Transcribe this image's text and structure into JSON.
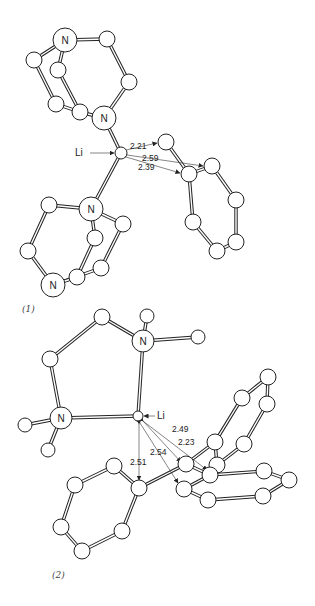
{
  "figure": {
    "structures": [
      {
        "id": "s1",
        "caption": "(1)",
        "caption_pos": [
          22,
          312
        ],
        "li_label": "Li",
        "li_label_pos": [
          75,
          156
        ],
        "li_arrow": [
          [
            90,
            153
          ],
          [
            114,
            153
          ]
        ],
        "atoms": [
          {
            "id": "N1",
            "x": 65,
            "y": 40,
            "r": 12,
            "label": "N"
          },
          {
            "id": "C1",
            "x": 107,
            "y": 39,
            "r": 8
          },
          {
            "id": "C2",
            "x": 129,
            "y": 82,
            "r": 8
          },
          {
            "id": "N2",
            "x": 104,
            "y": 118,
            "r": 12,
            "label": "N"
          },
          {
            "id": "C3",
            "x": 80,
            "y": 112,
            "r": 8
          },
          {
            "id": "C4",
            "x": 56,
            "y": 104,
            "r": 8
          },
          {
            "id": "C5",
            "x": 58,
            "y": 70,
            "r": 8
          },
          {
            "id": "C6",
            "x": 34,
            "y": 60,
            "r": 8
          },
          {
            "id": "Li",
            "x": 121,
            "y": 153,
            "r": 6
          },
          {
            "id": "N3",
            "x": 91,
            "y": 209,
            "r": 12,
            "label": "N"
          },
          {
            "id": "C7",
            "x": 49,
            "y": 205,
            "r": 8
          },
          {
            "id": "C8",
            "x": 123,
            "y": 224,
            "r": 8
          },
          {
            "id": "C9",
            "x": 95,
            "y": 238,
            "r": 8
          },
          {
            "id": "C10",
            "x": 28,
            "y": 251,
            "r": 8
          },
          {
            "id": "C11",
            "x": 101,
            "y": 268,
            "r": 8
          },
          {
            "id": "C12",
            "x": 77,
            "y": 277,
            "r": 8
          },
          {
            "id": "N4",
            "x": 53,
            "y": 285,
            "r": 12,
            "label": "N"
          },
          {
            "id": "P1",
            "x": 166,
            "y": 142,
            "r": 8
          },
          {
            "id": "P2",
            "x": 189,
            "y": 174,
            "r": 8
          },
          {
            "id": "P3",
            "x": 212,
            "y": 166,
            "r": 8
          },
          {
            "id": "P4",
            "x": 236,
            "y": 200,
            "r": 8
          },
          {
            "id": "P5",
            "x": 236,
            "y": 242,
            "r": 8
          },
          {
            "id": "P6",
            "x": 217,
            "y": 251,
            "r": 8
          },
          {
            "id": "P7",
            "x": 193,
            "y": 222,
            "r": 8
          }
        ],
        "bonds": [
          [
            "N1",
            "C1"
          ],
          [
            "C1",
            "C2"
          ],
          [
            "C2",
            "N2"
          ],
          [
            "N1",
            "C6"
          ],
          [
            "C6",
            "C4"
          ],
          [
            "C4",
            "C3"
          ],
          [
            "C3",
            "N2"
          ],
          [
            "N1",
            "C5"
          ],
          [
            "C5",
            "C3"
          ],
          [
            "N2",
            "Li"
          ],
          [
            "Li",
            "N3"
          ],
          [
            "N3",
            "C7"
          ],
          [
            "C7",
            "C10"
          ],
          [
            "C10",
            "N4"
          ],
          [
            "N3",
            "C8"
          ],
          [
            "C8",
            "C11"
          ],
          [
            "C11",
            "N4"
          ],
          [
            "N3",
            "C9"
          ],
          [
            "C9",
            "C12"
          ],
          [
            "C12",
            "N4"
          ],
          [
            "P1",
            "P2"
          ],
          [
            "P2",
            "P3"
          ],
          [
            "P3",
            "P4"
          ],
          [
            "P4",
            "P5"
          ],
          [
            "P5",
            "P6"
          ],
          [
            "P6",
            "P7"
          ],
          [
            "P7",
            "P2"
          ]
        ],
        "distances": [
          {
            "label": "2.21",
            "from": [
              126,
              150
            ],
            "to": [
              157,
              143
            ],
            "label_pos": [
              130,
              149
            ]
          },
          {
            "label": "2.59",
            "from": [
              127,
              155
            ],
            "to": [
              203,
              166
            ],
            "label_pos": [
              142,
              161
            ]
          },
          {
            "label": "2.39",
            "from": [
              126,
              157
            ],
            "to": [
              180,
              173
            ],
            "label_pos": [
              138,
              170
            ]
          }
        ]
      },
      {
        "id": "s2",
        "caption": "(2)",
        "caption_pos": [
          52,
          578
        ],
        "li_label": "Li",
        "li_label_pos": [
          157,
          419
        ],
        "li_arrow": [
          [
            155,
            416
          ],
          [
            144,
            416
          ]
        ],
        "atoms": [
          {
            "id": "A1",
            "x": 102,
            "y": 317,
            "r": 8
          },
          {
            "id": "A2",
            "x": 50,
            "y": 359,
            "r": 8
          },
          {
            "id": "N5",
            "x": 143,
            "y": 341,
            "r": 11,
            "label": "N"
          },
          {
            "id": "A3",
            "x": 147,
            "y": 316,
            "r": 7
          },
          {
            "id": "A4",
            "x": 198,
            "y": 337,
            "r": 7
          },
          {
            "id": "N6",
            "x": 61,
            "y": 418,
            "r": 11,
            "label": "N"
          },
          {
            "id": "A5",
            "x": 25,
            "y": 425,
            "r": 7
          },
          {
            "id": "A6",
            "x": 48,
            "y": 450,
            "r": 7
          },
          {
            "id": "Li2",
            "x": 138,
            "y": 416,
            "r": 5
          },
          {
            "id": "B1",
            "x": 139,
            "y": 488,
            "r": 8
          },
          {
            "id": "B2",
            "x": 114,
            "y": 466,
            "r": 8
          },
          {
            "id": "B3",
            "x": 75,
            "y": 485,
            "r": 8
          },
          {
            "id": "B4",
            "x": 61,
            "y": 527,
            "r": 8
          },
          {
            "id": "B5",
            "x": 82,
            "y": 551,
            "r": 8
          },
          {
            "id": "B6",
            "x": 122,
            "y": 531,
            "r": 8
          },
          {
            "id": "D1",
            "x": 186,
            "y": 464,
            "r": 8
          },
          {
            "id": "D2",
            "x": 215,
            "y": 442,
            "r": 8
          },
          {
            "id": "D3",
            "x": 242,
            "y": 398,
            "r": 8
          },
          {
            "id": "D4",
            "x": 268,
            "y": 377,
            "r": 8
          },
          {
            "id": "D5",
            "x": 267,
            "y": 404,
            "r": 8
          },
          {
            "id": "D6",
            "x": 244,
            "y": 444,
            "r": 8
          },
          {
            "id": "D7",
            "x": 217,
            "y": 465,
            "r": 8
          },
          {
            "id": "E1",
            "x": 210,
            "y": 475,
            "r": 8
          },
          {
            "id": "E2",
            "x": 184,
            "y": 489,
            "r": 8
          },
          {
            "id": "E3",
            "x": 208,
            "y": 500,
            "r": 8
          },
          {
            "id": "E4",
            "x": 263,
            "y": 496,
            "r": 8
          },
          {
            "id": "E5",
            "x": 289,
            "y": 480,
            "r": 8
          },
          {
            "id": "E6",
            "x": 264,
            "y": 471,
            "r": 8
          }
        ],
        "bonds": [
          [
            "A1",
            "A2"
          ],
          [
            "A1",
            "N5"
          ],
          [
            "N5",
            "A3"
          ],
          [
            "N5",
            "A4"
          ],
          [
            "A2",
            "N6"
          ],
          [
            "N6",
            "A5"
          ],
          [
            "N6",
            "A6"
          ],
          [
            "N6",
            "Li2"
          ],
          [
            "N5",
            "Li2"
          ],
          [
            "B1",
            "B2"
          ],
          [
            "B2",
            "B3"
          ],
          [
            "B3",
            "B4"
          ],
          [
            "B4",
            "B5"
          ],
          [
            "B5",
            "B6"
          ],
          [
            "B6",
            "B1"
          ],
          [
            "B1",
            "D1"
          ],
          [
            "D1",
            "D2"
          ],
          [
            "D2",
            "D3"
          ],
          [
            "D3",
            "D4"
          ],
          [
            "D4",
            "D5"
          ],
          [
            "D5",
            "D6"
          ],
          [
            "D6",
            "D7"
          ],
          [
            "D7",
            "D2"
          ],
          [
            "D1",
            "E1"
          ],
          [
            "E1",
            "E2"
          ],
          [
            "E2",
            "E3"
          ],
          [
            "E3",
            "E4"
          ],
          [
            "E4",
            "E5"
          ],
          [
            "E5",
            "E6"
          ],
          [
            "E6",
            "E1"
          ]
        ],
        "distances": [
          {
            "label": "2.49",
            "from": [
              143,
              421
            ],
            "to": [
              207,
              470
            ],
            "label_pos": [
              172,
              432
            ]
          },
          {
            "label": "2.23",
            "from": [
              143,
              421
            ],
            "to": [
              181,
              462
            ],
            "label_pos": [
              178,
              445
            ]
          },
          {
            "label": "2.54",
            "from": [
              140,
              423
            ],
            "to": [
              178,
              483
            ],
            "label_pos": [
              150,
              455
            ]
          },
          {
            "label": "2.51",
            "from": [
              139,
              424
            ],
            "to": [
              139,
              480
            ],
            "label_pos": [
              130,
              465
            ]
          }
        ]
      }
    ]
  }
}
